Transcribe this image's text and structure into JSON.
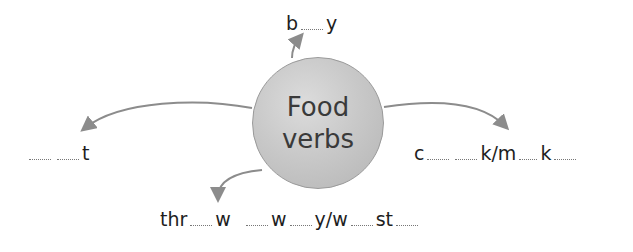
{
  "diagram": {
    "hub": {
      "line1": "Food",
      "line2": "verbs"
    },
    "branches": [
      {
        "id": "top",
        "parts": [
          "b",
          "",
          "y"
        ]
      },
      {
        "id": "left",
        "parts": [
          "",
          "",
          "t"
        ]
      },
      {
        "id": "right",
        "parts": [
          "c",
          "",
          "",
          "k/m",
          "",
          "k",
          ""
        ]
      },
      {
        "id": "bottom",
        "parts": [
          "thr",
          "",
          "w",
          "",
          "w",
          "",
          "y/w",
          "",
          "st",
          ""
        ]
      }
    ],
    "colors": {
      "arrow": "#8c8c8c",
      "hub_fill": "#c9c9c9",
      "text": "#1e1e1e"
    }
  }
}
